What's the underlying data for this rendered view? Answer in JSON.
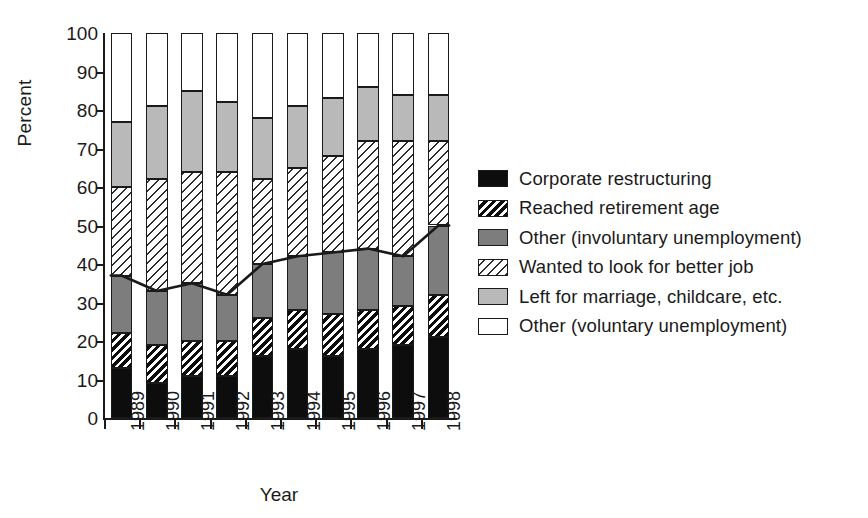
{
  "chart_data": {
    "type": "bar",
    "subtype": "stacked-bar-with-line-overlay",
    "title": "",
    "xlabel": "Year",
    "ylabel": "Percent",
    "ylim": [
      0,
      100
    ],
    "ytick_step": 10,
    "yticks": [
      0,
      10,
      20,
      30,
      40,
      50,
      60,
      70,
      80,
      90,
      100
    ],
    "ytick_labels": [
      "0",
      "10",
      "20",
      "30",
      "40",
      "50",
      "60",
      "70",
      "80",
      "90",
      "100"
    ],
    "grid": false,
    "legend_position": "right",
    "stacked_total": 100,
    "categories": [
      "1989",
      "1990",
      "1991",
      "1992",
      "1993",
      "1994",
      "1995",
      "1996",
      "1997",
      "1998"
    ],
    "series": [
      {
        "name": "Corporate restructuring",
        "pattern": "solid-black",
        "color": "#0d0d0d",
        "values": [
          13,
          9,
          11,
          11,
          16,
          18,
          16,
          18,
          19,
          21
        ]
      },
      {
        "name": "Reached retirement age",
        "pattern": "hatch-thick",
        "color": "#0d0d0d",
        "values": [
          9,
          10,
          9,
          9,
          10,
          10,
          11,
          10,
          10,
          11
        ]
      },
      {
        "name": "Other (involuntary unemployment)",
        "pattern": "dark-gray",
        "color": "#7d7d7d",
        "values": [
          15,
          14,
          15,
          12,
          14,
          14,
          16,
          16,
          13,
          18
        ]
      },
      {
        "name": "Wanted to look for better job",
        "pattern": "hatch-thin",
        "color": "#2b2b2b",
        "values": [
          23,
          29,
          29,
          32,
          22,
          23,
          25,
          28,
          30,
          22
        ]
      },
      {
        "name": "Left for marriage, childcare, etc.",
        "pattern": "light-gray",
        "color": "#b9b9b9",
        "values": [
          17,
          19,
          21,
          18,
          16,
          16,
          15,
          14,
          12,
          12
        ]
      },
      {
        "name": "Other (voluntary unemployment)",
        "pattern": "white",
        "color": "#ffffff",
        "values": [
          23,
          19,
          15,
          18,
          22,
          19,
          17,
          14,
          16,
          16
        ]
      }
    ],
    "overlay_line": {
      "name": "Total involuntary unemployment",
      "color": "#1a1a1a",
      "values": [
        37,
        33,
        35,
        32,
        40,
        42,
        43,
        44,
        42,
        50
      ]
    },
    "cumulative_tops": [
      [
        13,
        22,
        37,
        60,
        77,
        100
      ],
      [
        9,
        19,
        33,
        62,
        81,
        100
      ],
      [
        11,
        20,
        35,
        64,
        85,
        100
      ],
      [
        11,
        20,
        32,
        64,
        82,
        100
      ],
      [
        16,
        26,
        40,
        62,
        78,
        100
      ],
      [
        18,
        28,
        42,
        65,
        81,
        100
      ],
      [
        16,
        27,
        43,
        68,
        83,
        100
      ],
      [
        18,
        28,
        44,
        72,
        86,
        100
      ],
      [
        19,
        29,
        42,
        72,
        84,
        100
      ],
      [
        21,
        32,
        50,
        72,
        84,
        100
      ]
    ]
  },
  "legend": {
    "items": [
      {
        "label": "Corporate restructuring",
        "pattern": "solid-black"
      },
      {
        "label": "Reached retirement age",
        "pattern": "hatch-thick"
      },
      {
        "label": "Other (involuntary unemployment)",
        "pattern": "dark-gray"
      },
      {
        "label": "Wanted to look for better job",
        "pattern": "hatch-thin"
      },
      {
        "label": "Left for marriage, childcare, etc.",
        "pattern": "light-gray"
      },
      {
        "label": "Other (voluntary unemployment)",
        "pattern": "white"
      }
    ]
  }
}
